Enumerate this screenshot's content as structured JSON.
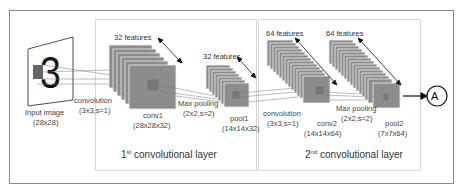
{
  "diagram": {
    "input": {
      "label": "Input image",
      "size": "(28x28)",
      "digit": "3"
    },
    "conv1_op": {
      "label": "convolution",
      "params": "(3x3,s=1)"
    },
    "conv1": {
      "features": "32 features",
      "label": "conv1",
      "size": "(28x28x32)"
    },
    "pool1_op": {
      "label": "Max pooling",
      "params": "(2x2,s=2)"
    },
    "pool1": {
      "features": "32 features",
      "label": "pool1",
      "size": "(14x14x32)"
    },
    "layer1": {
      "num": "1",
      "sup": "st",
      "title": "convolutional layer"
    },
    "conv2_op": {
      "label": "convolution",
      "params": "(3x3,s=1)"
    },
    "conv2": {
      "features": "64 features",
      "label": "conv2",
      "size": "(14x14x64)"
    },
    "pool2_op": {
      "label": "Max pooling",
      "params": "(2x2,s=2)"
    },
    "pool2": {
      "features": "64 features",
      "label": "pool2",
      "size": "(7x7x64)"
    },
    "layer2": {
      "num": "2",
      "sup": "nd",
      "title": "convolutional layer"
    },
    "output": {
      "label": "A"
    }
  },
  "colors": {
    "map_fill": "#8c8c8c",
    "map_stroke": "#f2f2f2",
    "inner_patch": "#7a7a7a",
    "border": "#8a8a8a",
    "line": "#555555"
  }
}
